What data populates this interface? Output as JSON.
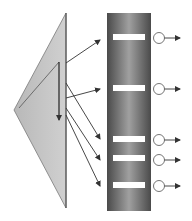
{
  "diagram": {
    "colors": {
      "background": "#ffffff",
      "prism_fill": "#c4c4c4",
      "prism_edge": "#7a7a7a",
      "column_dark": "#4a4a4a",
      "column_light": "#9a9a9a",
      "band": "#ffffff",
      "ray": "#333333",
      "detector": "#ffffff"
    },
    "prism": {
      "apex": [
        66,
        13
      ],
      "left_vertex": [
        14,
        110
      ],
      "bottom": [
        66,
        208
      ],
      "inner_line_start": [
        19,
        108
      ],
      "inner_line_end": [
        59,
        62
      ],
      "vertical_arrow": {
        "x": 59,
        "y1": 62,
        "y2": 120
      }
    },
    "column": {
      "x": 107,
      "y": 13,
      "width": 44,
      "height": 198
    },
    "bands": [
      {
        "y": 37,
        "label": ""
      },
      {
        "y": 88,
        "label": ""
      },
      {
        "y": 139,
        "label": ""
      },
      {
        "y": 158,
        "label": ""
      },
      {
        "y": 185,
        "label": ""
      }
    ],
    "rays": [
      {
        "from": [
          66,
          63
        ],
        "to": [
          100,
          40
        ]
      },
      {
        "from": [
          66,
          98
        ],
        "to": [
          100,
          89
        ]
      },
      {
        "from": [
          66,
          83
        ],
        "to": [
          100,
          139
        ]
      },
      {
        "from": [
          66,
          108
        ],
        "to": [
          100,
          160
        ]
      },
      {
        "from": [
          66,
          115
        ],
        "to": [
          100,
          186
        ]
      }
    ],
    "detectors": [
      {
        "cx": 159,
        "cy": 38
      },
      {
        "cx": 159,
        "cy": 89
      },
      {
        "cx": 159,
        "cy": 140
      },
      {
        "cx": 159,
        "cy": 160
      },
      {
        "cx": 159,
        "cy": 186
      }
    ],
    "output_arrow_end_x": 180
  }
}
